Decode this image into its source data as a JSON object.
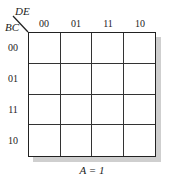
{
  "kmap": {
    "row_variable": "BC",
    "column_variable": "DE",
    "column_labels": [
      "00",
      "01",
      "11",
      "10"
    ],
    "row_labels": [
      "00",
      "01",
      "11",
      "10"
    ],
    "cells": [
      [
        "",
        "",
        "",
        ""
      ],
      [
        "",
        "",
        "",
        ""
      ],
      [
        "",
        "",
        "",
        ""
      ],
      [
        "",
        "",
        "",
        ""
      ]
    ],
    "caption": "A = 1",
    "colors": {
      "lines": "#222222",
      "shadow": "#cfcfcf",
      "background": "#ffffff"
    }
  }
}
